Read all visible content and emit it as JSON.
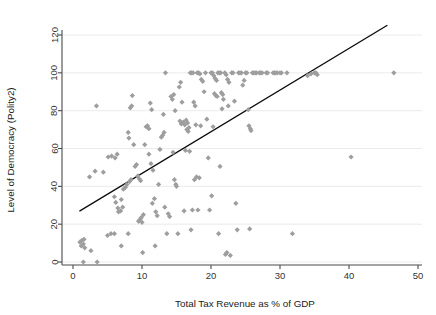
{
  "chart_data": {
    "type": "scatter",
    "title": "",
    "xlabel": "Total Tax Revenue as % of GDP",
    "ylabel": "Level of Democracy (Polity2)",
    "xlim": [
      0,
      50
    ],
    "ylim": [
      0,
      128
    ],
    "xticks": [
      0,
      10,
      20,
      30,
      40,
      50
    ],
    "yticks": [
      0,
      20,
      40,
      60,
      80,
      100,
      120
    ],
    "xticklabels": [
      "0",
      "10",
      "20",
      "30",
      "40",
      "50"
    ],
    "yticklabels": [
      "0",
      "20",
      "40",
      "60",
      "80",
      "100",
      "120"
    ],
    "grid": "horizontal",
    "legend": "none",
    "marker": "diamond",
    "marker_color": "#9e9e9e",
    "fit_line": {
      "label": "linear fit",
      "color": "#0d0d0d",
      "x": [
        1.0,
        45.5
      ],
      "y": [
        27.0,
        125.0
      ]
    },
    "points": [
      [
        1.0,
        10.5
      ],
      [
        1.2,
        8.5
      ],
      [
        1.3,
        11.5
      ],
      [
        1.5,
        9.5
      ],
      [
        1.6,
        12.0
      ],
      [
        1.7,
        7.5
      ],
      [
        1.5,
        0.0
      ],
      [
        3.5,
        0.0
      ],
      [
        2.6,
        6.0
      ],
      [
        3.4,
        82.5
      ],
      [
        2.4,
        45.0
      ],
      [
        3.2,
        48.0
      ],
      [
        4.4,
        47.5
      ],
      [
        5.0,
        14.0
      ],
      [
        5.5,
        15.0
      ],
      [
        6.0,
        15.0
      ],
      [
        5.1,
        55.5
      ],
      [
        5.6,
        56.0
      ],
      [
        6.1,
        55.0
      ],
      [
        6.4,
        57.0
      ],
      [
        6.0,
        34.5
      ],
      [
        6.2,
        31.5
      ],
      [
        6.5,
        28.5
      ],
      [
        6.6,
        26.5
      ],
      [
        6.9,
        27.0
      ],
      [
        7.0,
        33.0
      ],
      [
        7.2,
        29.0
      ],
      [
        7.3,
        38.5
      ],
      [
        7.6,
        39.5
      ],
      [
        7.8,
        41.0
      ],
      [
        7.0,
        8.5
      ],
      [
        8.0,
        15.0
      ],
      [
        8.2,
        42.5
      ],
      [
        8.4,
        43.5
      ],
      [
        8.1,
        65.5
      ],
      [
        8.0,
        68.5
      ],
      [
        8.3,
        81.5
      ],
      [
        8.5,
        82.5
      ],
      [
        8.6,
        88.0
      ],
      [
        8.8,
        62.0
      ],
      [
        9.0,
        50.5
      ],
      [
        9.2,
        51.5
      ],
      [
        9.4,
        45.5
      ],
      [
        9.6,
        44.0
      ],
      [
        9.8,
        43.0
      ],
      [
        9.5,
        21.5
      ],
      [
        9.7,
        22.5
      ],
      [
        9.9,
        23.5
      ],
      [
        10.0,
        21.0
      ],
      [
        10.2,
        25.0
      ],
      [
        10.1,
        5.0
      ],
      [
        10.4,
        62.0
      ],
      [
        10.6,
        71.5
      ],
      [
        10.8,
        72.0
      ],
      [
        11.0,
        70.5
      ],
      [
        11.2,
        84.0
      ],
      [
        11.4,
        80.5
      ],
      [
        11.0,
        57.0
      ],
      [
        11.3,
        52.0
      ],
      [
        11.6,
        48.5
      ],
      [
        11.5,
        31.0
      ],
      [
        11.8,
        33.5
      ],
      [
        12.0,
        26.5
      ],
      [
        12.2,
        24.5
      ],
      [
        11.9,
        8.5
      ],
      [
        12.4,
        41.0
      ],
      [
        12.6,
        59.5
      ],
      [
        12.8,
        66.0
      ],
      [
        13.0,
        67.0
      ],
      [
        13.2,
        68.5
      ],
      [
        13.4,
        100.0
      ],
      [
        13.1,
        78.0
      ],
      [
        13.3,
        29.0
      ],
      [
        13.6,
        15.0
      ],
      [
        13.8,
        25.5
      ],
      [
        14.0,
        24.0
      ],
      [
        14.2,
        87.5
      ],
      [
        14.4,
        86.0
      ],
      [
        14.6,
        88.5
      ],
      [
        14.8,
        80.0
      ],
      [
        14.5,
        58.0
      ],
      [
        14.7,
        43.5
      ],
      [
        14.9,
        41.0
      ],
      [
        15.0,
        40.0
      ],
      [
        15.2,
        15.0
      ],
      [
        15.4,
        92.5
      ],
      [
        15.6,
        95.0
      ],
      [
        15.8,
        84.5
      ],
      [
        15.5,
        74.5
      ],
      [
        15.7,
        73.0
      ],
      [
        16.0,
        74.0
      ],
      [
        16.2,
        72.5
      ],
      [
        16.4,
        75.0
      ],
      [
        16.6,
        73.5
      ],
      [
        16.8,
        71.0
      ],
      [
        16.5,
        70.0
      ],
      [
        16.7,
        69.0
      ],
      [
        16.3,
        59.0
      ],
      [
        16.9,
        58.5
      ],
      [
        16.1,
        27.0
      ],
      [
        17.0,
        100.0
      ],
      [
        17.2,
        100.0
      ],
      [
        17.4,
        100.0
      ],
      [
        17.5,
        84.5
      ],
      [
        17.7,
        82.5
      ],
      [
        17.8,
        72.5
      ],
      [
        17.9,
        45.0
      ],
      [
        17.6,
        43.5
      ],
      [
        17.3,
        27.5
      ],
      [
        17.1,
        17.0
      ],
      [
        18.0,
        100.0
      ],
      [
        18.2,
        100.0
      ],
      [
        18.4,
        99.5
      ],
      [
        18.6,
        96.5
      ],
      [
        18.8,
        95.5
      ],
      [
        18.5,
        72.0
      ],
      [
        18.3,
        44.5
      ],
      [
        18.1,
        27.5
      ],
      [
        19.0,
        90.0
      ],
      [
        19.2,
        100.0
      ],
      [
        19.4,
        75.5
      ],
      [
        19.6,
        55.0
      ],
      [
        19.8,
        27.5
      ],
      [
        20.0,
        100.0
      ],
      [
        20.2,
        100.0
      ],
      [
        20.4,
        98.5
      ],
      [
        20.6,
        97.0
      ],
      [
        20.8,
        96.0
      ],
      [
        20.5,
        89.0
      ],
      [
        20.7,
        88.0
      ],
      [
        20.9,
        87.5
      ],
      [
        20.3,
        71.5
      ],
      [
        20.1,
        35.0
      ],
      [
        21.0,
        100.0
      ],
      [
        21.2,
        100.0
      ],
      [
        21.4,
        100.0
      ],
      [
        21.5,
        89.5
      ],
      [
        21.7,
        88.5
      ],
      [
        21.8,
        86.0
      ],
      [
        21.6,
        81.0
      ],
      [
        21.3,
        50.5
      ],
      [
        21.1,
        15.0
      ],
      [
        22.0,
        100.0
      ],
      [
        22.2,
        99.0
      ],
      [
        22.4,
        96.5
      ],
      [
        22.6,
        95.0
      ],
      [
        22.5,
        82.5
      ],
      [
        22.3,
        5.0
      ],
      [
        22.1,
        4.0
      ],
      [
        22.8,
        3.5
      ],
      [
        23.0,
        100.0
      ],
      [
        23.2,
        100.0
      ],
      [
        23.4,
        85.0
      ],
      [
        23.6,
        31.0
      ],
      [
        23.8,
        17.0
      ],
      [
        24.0,
        100.0
      ],
      [
        24.2,
        100.0
      ],
      [
        24.4,
        100.0
      ],
      [
        24.6,
        93.5
      ],
      [
        24.8,
        96.0
      ],
      [
        25.0,
        100.0
      ],
      [
        25.2,
        100.0
      ],
      [
        25.4,
        80.5
      ],
      [
        25.5,
        72.0
      ],
      [
        25.7,
        70.5
      ],
      [
        25.8,
        69.5
      ],
      [
        25.6,
        17.5
      ],
      [
        26.0,
        100.0
      ],
      [
        26.2,
        100.0
      ],
      [
        26.4,
        100.0
      ],
      [
        26.6,
        100.0
      ],
      [
        27.0,
        100.0
      ],
      [
        27.2,
        100.0
      ],
      [
        27.4,
        100.0
      ],
      [
        28.0,
        100.0
      ],
      [
        28.2,
        100.0
      ],
      [
        29.0,
        100.0
      ],
      [
        29.2,
        100.0
      ],
      [
        29.4,
        100.0
      ],
      [
        29.6,
        100.0
      ],
      [
        30.0,
        100.0
      ],
      [
        30.2,
        100.0
      ],
      [
        31.0,
        100.0
      ],
      [
        31.8,
        15.0
      ],
      [
        34.0,
        98.5
      ],
      [
        34.5,
        99.5
      ],
      [
        35.0,
        100.0
      ],
      [
        35.2,
        100.0
      ],
      [
        35.4,
        99.0
      ],
      [
        40.3,
        55.5
      ],
      [
        46.5,
        100.0
      ]
    ]
  }
}
